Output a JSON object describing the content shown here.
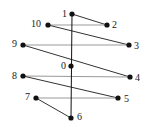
{
  "diagram": {
    "type": "graph",
    "nodes": [
      {
        "id": "0",
        "label": "0",
        "x": 71,
        "y": 66,
        "label_dx": -10,
        "label_dy": -5
      },
      {
        "id": "1",
        "label": "1",
        "x": 72,
        "y": 14,
        "label_dx": -10,
        "label_dy": -5
      },
      {
        "id": "2",
        "label": "2",
        "x": 107,
        "y": 25,
        "label_dx": 5,
        "label_dy": -5
      },
      {
        "id": "3",
        "label": "3",
        "x": 129,
        "y": 45,
        "label_dx": 5,
        "label_dy": -4
      },
      {
        "id": "4",
        "label": "4",
        "x": 130,
        "y": 77,
        "label_dx": 5,
        "label_dy": -4
      },
      {
        "id": "5",
        "label": "5",
        "x": 118,
        "y": 98,
        "label_dx": 6,
        "label_dy": -4
      },
      {
        "id": "6",
        "label": "6",
        "x": 71,
        "y": 118,
        "label_dx": 6,
        "label_dy": -6
      },
      {
        "id": "7",
        "label": "7",
        "x": 36,
        "y": 98,
        "label_dx": -11,
        "label_dy": -6
      },
      {
        "id": "8",
        "label": "8",
        "x": 23,
        "y": 76,
        "label_dx": -11,
        "label_dy": -5
      },
      {
        "id": "9",
        "label": "9",
        "x": 23,
        "y": 45,
        "label_dx": -11,
        "label_dy": -6
      },
      {
        "id": "10",
        "label": "10",
        "x": 48,
        "y": 25,
        "label_dx": -17,
        "label_dy": -6
      }
    ],
    "edges": [
      {
        "from": "1",
        "to": "2",
        "color": "#333333"
      },
      {
        "from": "2",
        "to": "10",
        "color": "#999999"
      },
      {
        "from": "10",
        "to": "3",
        "color": "#333333"
      },
      {
        "from": "3",
        "to": "9",
        "color": "#999999"
      },
      {
        "from": "9",
        "to": "4",
        "color": "#333333"
      },
      {
        "from": "4",
        "to": "8",
        "color": "#999999"
      },
      {
        "from": "8",
        "to": "5",
        "color": "#333333"
      },
      {
        "from": "5",
        "to": "7",
        "color": "#999999"
      },
      {
        "from": "7",
        "to": "6",
        "color": "#333333"
      },
      {
        "from": "1",
        "to": "6",
        "color": "#111111"
      }
    ],
    "node_color": "#111111",
    "node_radius": 2.6
  }
}
